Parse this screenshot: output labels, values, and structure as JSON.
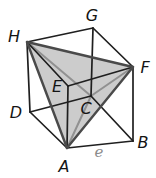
{
  "diagram": {
    "canvas": {
      "width": 156,
      "height": 178,
      "background": "#ffffff"
    },
    "colors": {
      "cube_edge": "#1f1f1f",
      "tetra_outer_edge": "#4a4a4a",
      "tetra_inner_edge": "#919191",
      "tetra_fill": "#c8c8c8",
      "tetra_fill_opacity": "0.92",
      "vertex_label": "#141414",
      "edge_label": "#8c8c8c"
    },
    "vertices": {
      "A": [
        67,
        148
      ],
      "B": [
        133,
        141
      ],
      "C": [
        91,
        96
      ],
      "D": [
        30,
        112
      ],
      "E": [
        68,
        86
      ],
      "F": [
        133,
        67
      ],
      "G": [
        93,
        28
      ],
      "H": [
        27,
        42
      ]
    },
    "cube_edges": [
      [
        "A",
        "B"
      ],
      [
        "B",
        "C"
      ],
      [
        "C",
        "D"
      ],
      [
        "D",
        "A"
      ],
      [
        "E",
        "F"
      ],
      [
        "F",
        "G"
      ],
      [
        "G",
        "H"
      ],
      [
        "H",
        "E"
      ],
      [
        "A",
        "E"
      ],
      [
        "B",
        "F"
      ],
      [
        "C",
        "G"
      ],
      [
        "D",
        "H"
      ]
    ],
    "tetra": {
      "fill_polygon": [
        "H",
        "F",
        "A"
      ],
      "inner_edges": [
        [
          "H",
          "C"
        ],
        [
          "F",
          "C"
        ],
        [
          "A",
          "C"
        ]
      ],
      "outer_edges": [
        [
          "H",
          "F"
        ],
        [
          "F",
          "A"
        ],
        [
          "A",
          "H"
        ]
      ]
    },
    "vertex_labels": [
      {
        "text": "G",
        "x": 92,
        "y": 15
      },
      {
        "text": "H",
        "x": 14,
        "y": 36
      },
      {
        "text": "F",
        "x": 145,
        "y": 67
      },
      {
        "text": "E",
        "x": 57,
        "y": 86
      },
      {
        "text": "C",
        "x": 86,
        "y": 108
      },
      {
        "text": "D",
        "x": 16,
        "y": 112
      },
      {
        "text": "B",
        "x": 143,
        "y": 142
      },
      {
        "text": "A",
        "x": 64,
        "y": 166
      }
    ],
    "edge_labels": [
      {
        "text": "e",
        "x": 99,
        "y": 152
      }
    ]
  }
}
